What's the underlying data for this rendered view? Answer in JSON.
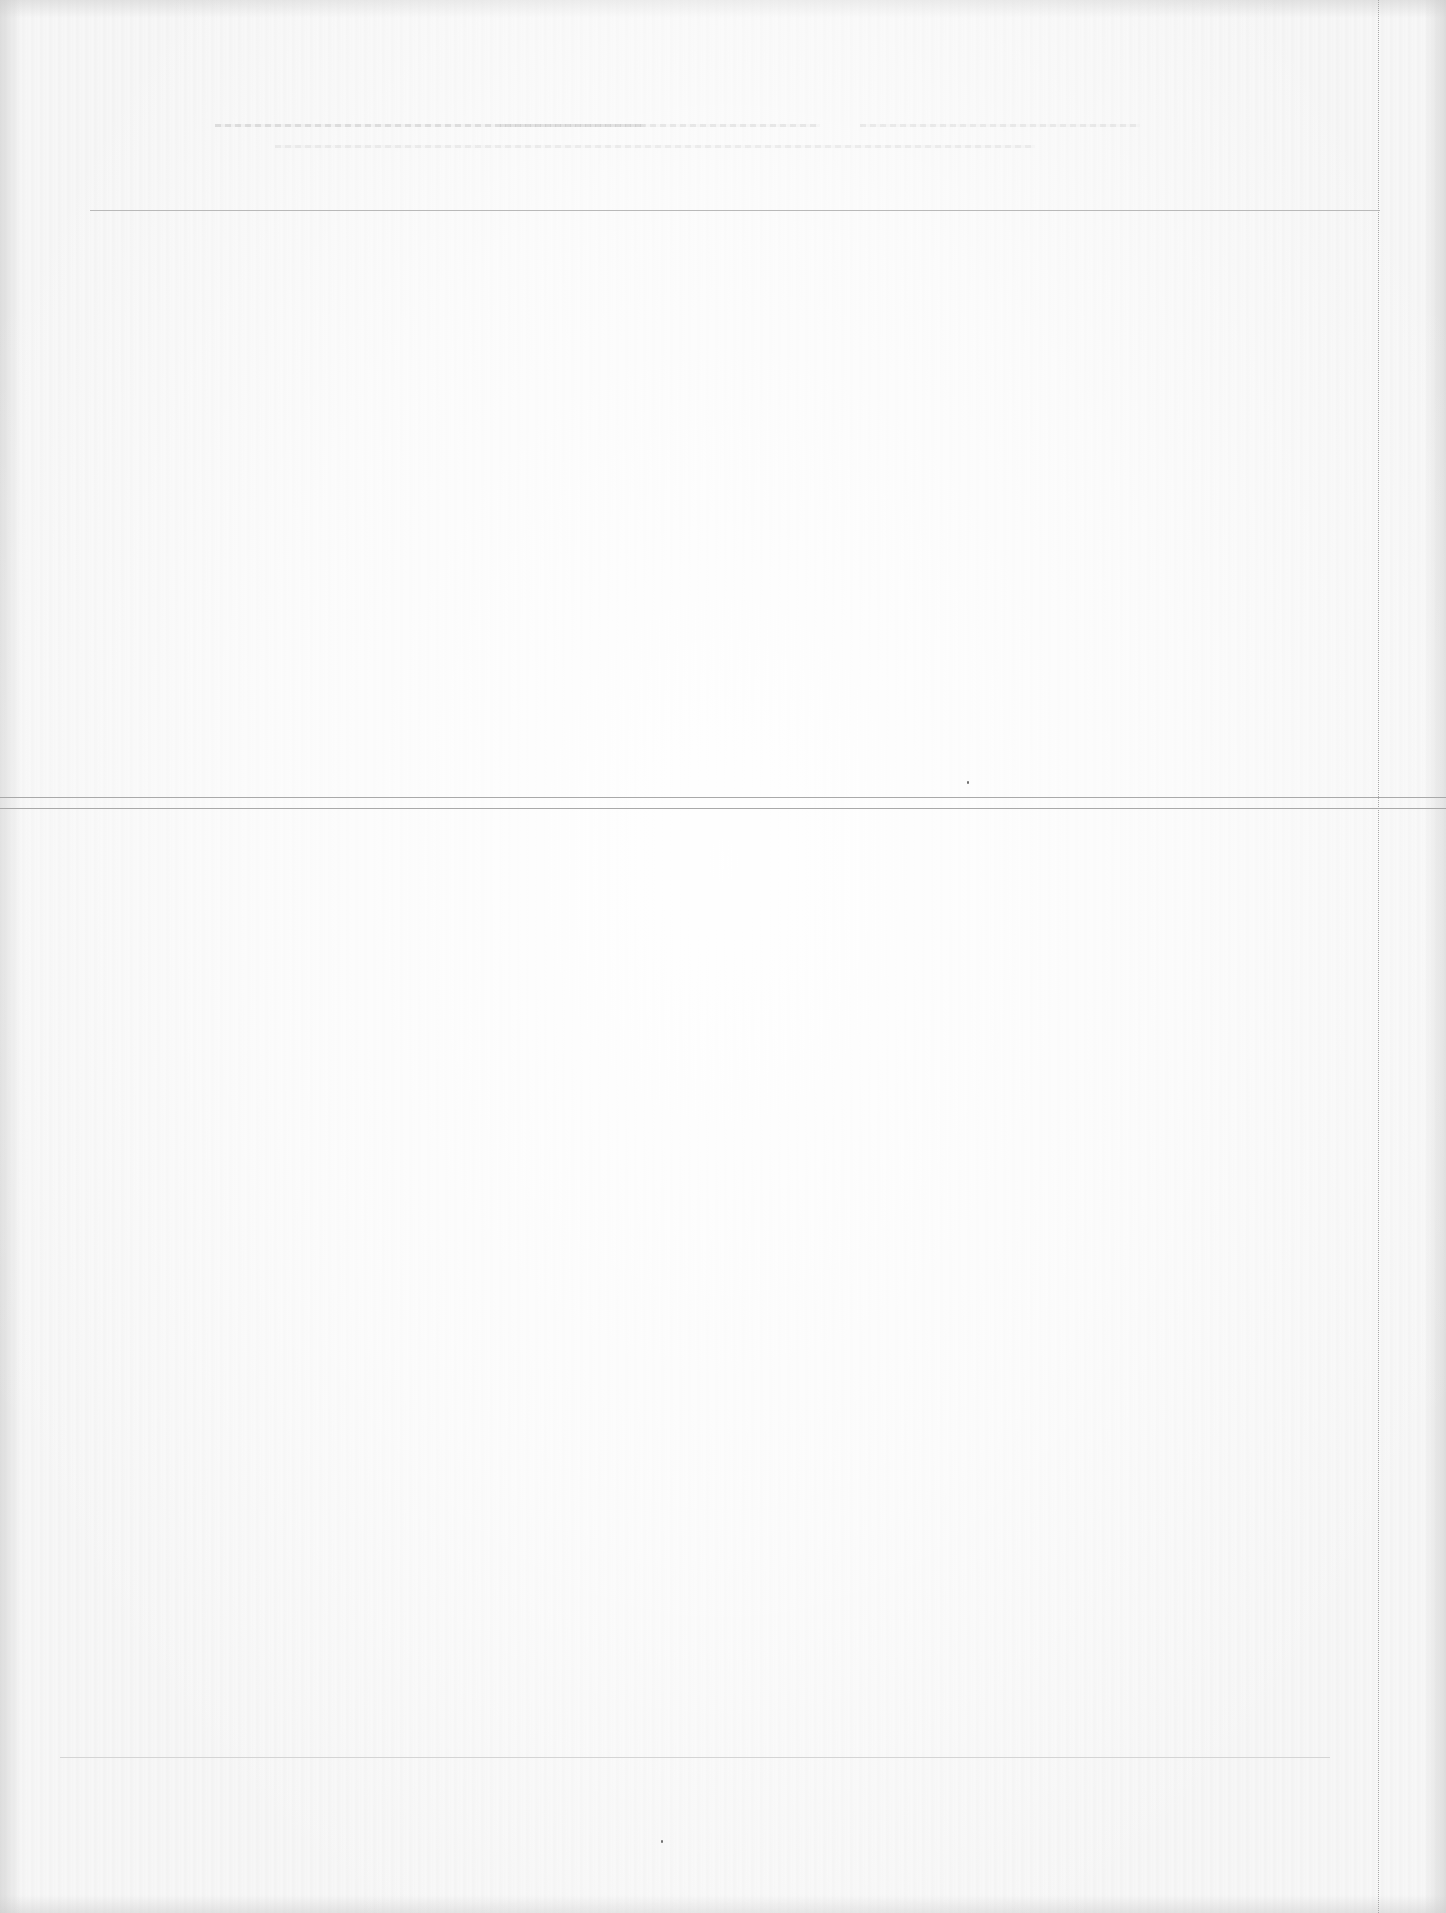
{
  "document": {
    "type": "scanned page",
    "legible_text": [],
    "note_visible": "",
    "colors": {
      "paper": "#f7f7f7",
      "rule": "#b9b9b9",
      "rule_strong": "#a9a9a9",
      "perforation": "#a8a8a8"
    },
    "regions": {
      "header_ghost_text": {
        "lines": 2,
        "legible": false
      },
      "upper_section": {
        "legible": false
      },
      "lower_section": {
        "legible": false
      }
    },
    "rules": [
      {
        "name": "header-rule",
        "y": 210,
        "x1": 90,
        "x2": 1380
      },
      {
        "name": "divider-rule-top",
        "y": 797,
        "x1": 0,
        "x2": 1446
      },
      {
        "name": "divider-rule-bottom",
        "y": 808,
        "x1": 0,
        "x2": 1446
      },
      {
        "name": "footer-rule",
        "y": 1757,
        "x1": 60,
        "x2": 1330
      }
    ],
    "perforation": {
      "x": 1378,
      "style": "dotted"
    }
  }
}
